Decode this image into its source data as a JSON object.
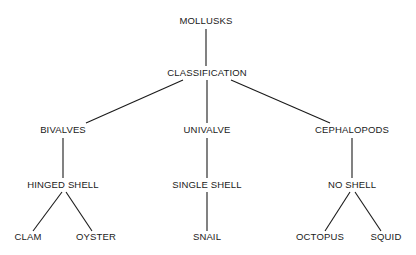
{
  "diagram": {
    "title": "MOLLUSKS",
    "type": "hierarchy-tree",
    "orientation": "top-down",
    "canvas": {
      "width": 416,
      "height": 255
    },
    "colors": {
      "background": "#ffffff",
      "line": "#1a1a1a",
      "text": "#1a1a1a"
    },
    "levels": [
      {
        "name": "root",
        "y": 24
      },
      {
        "name": "classification",
        "y": 76
      },
      {
        "name": "classes",
        "y": 133
      },
      {
        "name": "shell-type",
        "y": 188
      },
      {
        "name": "examples",
        "y": 240
      }
    ],
    "nodes": [
      {
        "id": "mollusks",
        "label": "MOLLUSKS",
        "x": 206,
        "y": 24,
        "level": 0
      },
      {
        "id": "classification",
        "label": "CLASSIFICATION",
        "x": 207,
        "y": 76,
        "level": 1
      },
      {
        "id": "bivalves",
        "label": "BIVALVES",
        "x": 63,
        "y": 133,
        "level": 2
      },
      {
        "id": "univalve",
        "label": "UNIVALVE",
        "x": 207,
        "y": 133,
        "level": 2
      },
      {
        "id": "cephalopods",
        "label": "CEPHALOPODS",
        "x": 352,
        "y": 133,
        "level": 2
      },
      {
        "id": "hinged-shell",
        "label": "HINGED SHELL",
        "x": 63,
        "y": 188,
        "level": 3
      },
      {
        "id": "single-shell",
        "label": "SINGLE SHELL",
        "x": 207,
        "y": 188,
        "level": 3
      },
      {
        "id": "no-shell",
        "label": "NO SHELL",
        "x": 352,
        "y": 188,
        "level": 3
      },
      {
        "id": "clam",
        "label": "CLAM",
        "x": 28,
        "y": 240,
        "level": 4
      },
      {
        "id": "oyster",
        "label": "OYSTER",
        "x": 96,
        "y": 240,
        "level": 4
      },
      {
        "id": "snail",
        "label": "SNAIL",
        "x": 207,
        "y": 240,
        "level": 4
      },
      {
        "id": "octopus",
        "label": "OCTOPUS",
        "x": 320,
        "y": 240,
        "level": 4
      },
      {
        "id": "squid",
        "label": "SQUID",
        "x": 386,
        "y": 240,
        "level": 4
      }
    ],
    "edges": [
      {
        "id": "mollusks-classification",
        "from": "mollusks",
        "to": "classification",
        "x1": 206,
        "y1": 29,
        "x2": 206,
        "y2": 66
      },
      {
        "id": "classification-bivalves",
        "from": "classification",
        "to": "bivalves",
        "x1": 183,
        "y1": 80,
        "x2": 86,
        "y2": 123
      },
      {
        "id": "classification-univalve",
        "from": "classification",
        "to": "univalve",
        "x1": 207,
        "y1": 80,
        "x2": 207,
        "y2": 123
      },
      {
        "id": "classification-cephalopods",
        "from": "classification",
        "to": "cephalopods",
        "x1": 231,
        "y1": 80,
        "x2": 330,
        "y2": 123
      },
      {
        "id": "bivalves-hinged",
        "from": "bivalves",
        "to": "hinged-shell",
        "x1": 63,
        "y1": 138,
        "x2": 63,
        "y2": 178
      },
      {
        "id": "univalve-single",
        "from": "univalve",
        "to": "single-shell",
        "x1": 207,
        "y1": 138,
        "x2": 207,
        "y2": 178
      },
      {
        "id": "cephalopods-noshell",
        "from": "cephalopods",
        "to": "no-shell",
        "x1": 352,
        "y1": 138,
        "x2": 352,
        "y2": 178
      },
      {
        "id": "hinged-clam",
        "from": "hinged-shell",
        "to": "clam",
        "x1": 62,
        "y1": 192,
        "x2": 33,
        "y2": 231
      },
      {
        "id": "hinged-oyster",
        "from": "hinged-shell",
        "to": "oyster",
        "x1": 66,
        "y1": 192,
        "x2": 92,
        "y2": 231
      },
      {
        "id": "single-snail",
        "from": "single-shell",
        "to": "snail",
        "x1": 207,
        "y1": 192,
        "x2": 207,
        "y2": 231
      },
      {
        "id": "noshell-octopus",
        "from": "no-shell",
        "to": "octopus",
        "x1": 350,
        "y1": 192,
        "x2": 325,
        "y2": 231
      },
      {
        "id": "noshell-squid",
        "from": "no-shell",
        "to": "squid",
        "x1": 355,
        "y1": 192,
        "x2": 381,
        "y2": 231
      }
    ]
  }
}
